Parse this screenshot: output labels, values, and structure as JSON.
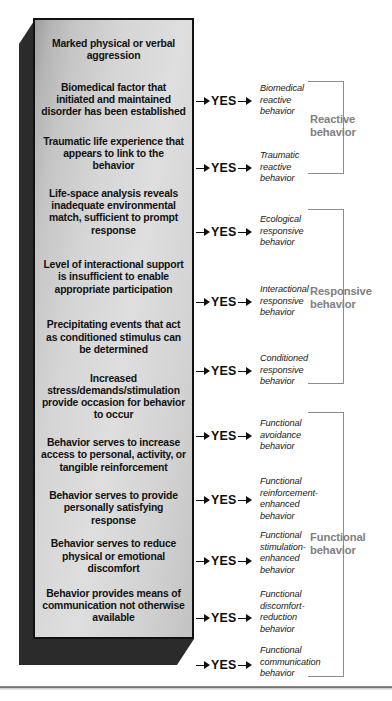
{
  "diagram": {
    "colors": {
      "box_border": "#111111",
      "box_fill_light": "#dedede",
      "box_fill_dark": "#9d9d9d",
      "bevel": "#2b2b2b",
      "bracket": "#8d8d8d",
      "group_label": "#808080",
      "text": "#121212"
    },
    "criteria": [
      {
        "id": "marked-aggression",
        "text": "Marked physical or verbal aggression"
      },
      {
        "id": "biomedical-factor",
        "text": "Biomedical factor that initiated and maintained disorder has been established"
      },
      {
        "id": "traumatic-experience",
        "text": "Traumatic life experience that appears to link to the behavior"
      },
      {
        "id": "life-space-analysis",
        "text": "Life-space analysis reveals inadequate environmental match, sufficient to prompt response"
      },
      {
        "id": "interactional-support",
        "text": "Level of interactional support is insufficient to enable appropriate participation"
      },
      {
        "id": "precipitating-events",
        "text": "Precipitating events that act as conditioned stimulus can be determined"
      },
      {
        "id": "increased-stress",
        "text": "Increased stress/demands/stimulation provide occasion for behavior to occur"
      },
      {
        "id": "increase-access",
        "text": "Behavior serves to increase access to personal, activity, or tangible reinforcement"
      },
      {
        "id": "satisfying-response",
        "text": "Behavior serves to provide personally satisfying response"
      },
      {
        "id": "reduce-discomfort",
        "text": "Behavior serves to reduce physical or emotional discomfort"
      },
      {
        "id": "means-of-communication",
        "text": "Behavior provides means of communication not otherwise available"
      }
    ],
    "decision_label": "YES",
    "decisions": [
      {
        "id": "yes-biomedical",
        "label": "YES",
        "top": 93,
        "outcome": "Biomedical reactive behavior",
        "outcome_top": 83
      },
      {
        "id": "yes-traumatic",
        "label": "YES",
        "top": 160,
        "outcome": "Traumatic reactive behavior",
        "outcome_top": 150
      },
      {
        "id": "yes-ecological",
        "label": "YES",
        "top": 224,
        "outcome": "Ecological responsive behavior",
        "outcome_top": 214
      },
      {
        "id": "yes-interactional",
        "label": "YES",
        "top": 294,
        "outcome": "Interactional responsive behavior",
        "outcome_top": 284
      },
      {
        "id": "yes-conditioned",
        "label": "YES",
        "top": 363,
        "outcome": "Conditioned responsive behavior",
        "outcome_top": 353
      },
      {
        "id": "yes-avoidance",
        "label": "YES",
        "top": 428,
        "outcome": "Functional avoidance behavior",
        "outcome_top": 418
      },
      {
        "id": "yes-reinforcement",
        "label": "YES",
        "top": 492,
        "outcome": "Functional reinforcement-enhanced behavior",
        "outcome_top": 476
      },
      {
        "id": "yes-stimulation",
        "label": "YES",
        "top": 553,
        "outcome": "Functional stimulation-enhanced behavior",
        "outcome_top": 530
      },
      {
        "id": "yes-discomfort",
        "label": "YES",
        "top": 610,
        "outcome": "Functional discomfort-reduction behavior",
        "outcome_top": 589
      },
      {
        "id": "yes-communication",
        "label": "YES",
        "top": 657,
        "outcome": "Functional communication behavior",
        "outcome_top": 645
      }
    ],
    "groups": [
      {
        "id": "reactive",
        "label": "Reactive behavior",
        "top": 81,
        "height": 93,
        "label_top": 113
      },
      {
        "id": "responsive",
        "label": "Responsive behavior",
        "top": 209,
        "height": 175,
        "label_top": 285
      },
      {
        "id": "functional",
        "label": "Functional behavior",
        "top": 412,
        "height": 265,
        "label_top": 531
      }
    ]
  }
}
